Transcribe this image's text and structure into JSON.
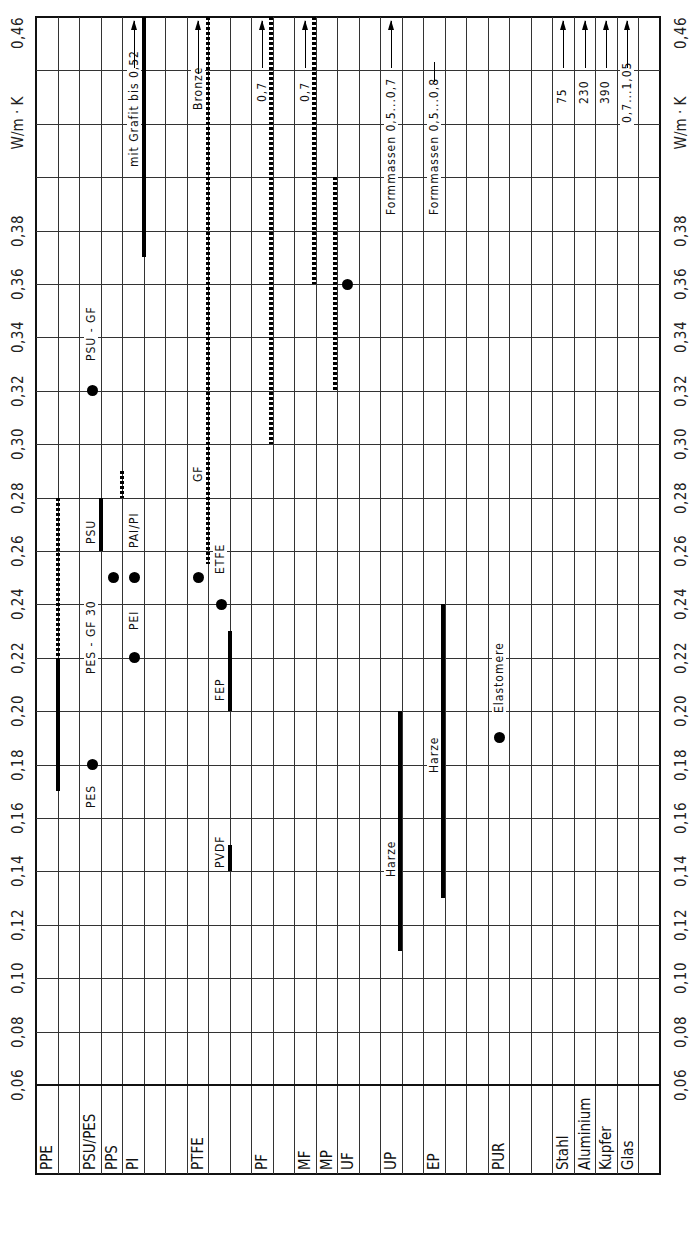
{
  "chart_data": {
    "type": "range-bar",
    "orientation": "rotated-90",
    "title": "",
    "ylabel": "W/m·K",
    "ylim": [
      0.06,
      0.46
    ],
    "y_ticks": [
      "0,06",
      "0,08",
      "0,10",
      "0,12",
      "0,14",
      "0,16",
      "0,18",
      "0,20",
      "0,22",
      "0,24",
      "0,26",
      "0,28",
      "0,30",
      "0,32",
      "0,34",
      "0,36",
      "0,38",
      "W/m·K",
      "0,46"
    ],
    "unit_label": "W/m·K",
    "grid": true,
    "categories": [
      "PPE",
      "PSU/PES",
      "PPS",
      "PI",
      "PTFE",
      "PF",
      "MF",
      "MP",
      "UF",
      "UP",
      "EP",
      "PUR",
      "Stahl",
      "Aluminium",
      "Kupfer",
      "Glas"
    ],
    "ranges": [
      {
        "material": "PPE",
        "style": "solid",
        "from": 0.17,
        "to": 0.22
      },
      {
        "material": "PPE",
        "style": "dotted",
        "from": 0.22,
        "to": 0.28
      },
      {
        "material": "PSU",
        "label": "PSU",
        "style": "solid",
        "from": 0.26,
        "to": 0.28
      },
      {
        "material": "PPS",
        "style": "dotted",
        "from": 0.28,
        "to": 0.29
      },
      {
        "material": "PI",
        "label": "mit Grafit  bis 0,52",
        "style": "solid",
        "from": 0.37,
        "to": 0.46,
        "arrow": true
      },
      {
        "material": "PTFE",
        "label": "GF",
        "style": "dotted",
        "from": 0.255,
        "to": 0.46
      },
      {
        "material": "PTFE",
        "label": "Bronze",
        "style": "dotted",
        "from": 0.4,
        "to": 0.46,
        "arrow": true
      },
      {
        "material": "FEP",
        "label": "FEP",
        "style": "solid",
        "from": 0.2,
        "to": 0.23
      },
      {
        "material": "PVDF",
        "label": "PVDF",
        "style": "solid",
        "from": 0.14,
        "to": 0.15
      },
      {
        "material": "PF",
        "label": "0,7",
        "style": "dotted",
        "from": 0.3,
        "to": 0.46,
        "arrow": true
      },
      {
        "material": "MF",
        "label": "0,7",
        "style": "dotted",
        "from": 0.36,
        "to": 0.46,
        "arrow": true
      },
      {
        "material": "UF",
        "style": "dotted",
        "from": 0.32,
        "to": 0.4
      },
      {
        "material": "UP",
        "label": "Harze",
        "style": "solid",
        "from": 0.11,
        "to": 0.2
      },
      {
        "material": "UP",
        "label": "Formmassen  0,5...0,7",
        "style": "arrow",
        "from": 0.46,
        "to": 0.7
      },
      {
        "material": "EP",
        "label": "Harze",
        "style": "solid",
        "from": 0.13,
        "to": 0.24
      },
      {
        "material": "EP",
        "label": "Formmassen  0,5...0,8",
        "style": "arrow",
        "from": 0.46,
        "to": 0.8
      },
      {
        "material": "Stahl",
        "label": "75",
        "style": "arrow",
        "value": 75
      },
      {
        "material": "Aluminium",
        "label": "230",
        "style": "arrow",
        "value": 230
      },
      {
        "material": "Kupfer",
        "label": "390",
        "style": "arrow",
        "value": 390
      },
      {
        "material": "Glas",
        "label": "0,7...1,05",
        "style": "arrow",
        "from": 0.7,
        "to": 1.05
      }
    ],
    "points": [
      {
        "label": "PES",
        "value": 0.18
      },
      {
        "label": "PES-GF30",
        "value": 0.24
      },
      {
        "label": "PSU-GF",
        "value": 0.32
      },
      {
        "label": "PPS",
        "value": 0.25
      },
      {
        "label": "PAI/PI",
        "value": 0.25
      },
      {
        "label": "PEI",
        "value": 0.22
      },
      {
        "label": "PTFE",
        "value": 0.25
      },
      {
        "label": "ETFE",
        "value": 0.24
      },
      {
        "label": "UF",
        "value": 0.36
      },
      {
        "label": "Elastomere",
        "value": 0.19
      }
    ]
  },
  "axis": {
    "ticks": [
      "0,06",
      "0,08",
      "0,10",
      "0,12",
      "0,14",
      "0,16",
      "0,18",
      "0,20",
      "0,22",
      "0,24",
      "0,26",
      "0,28",
      "0,30",
      "0,32",
      "0,34",
      "0,36",
      "0,38"
    ],
    "top": "0,46",
    "unit": "W/m · K"
  },
  "materials": [
    {
      "label": "PPE",
      "col": 0
    },
    {
      "label": "PSU/PES",
      "col": 2
    },
    {
      "label": "PPS",
      "col": 3
    },
    {
      "label": "PI",
      "col": 4
    },
    {
      "label": "PTFE",
      "col": 7
    },
    {
      "label": "PF",
      "col": 10
    },
    {
      "label": "MF",
      "col": 12
    },
    {
      "label": "MP",
      "col": 13
    },
    {
      "label": "UF",
      "col": 14
    },
    {
      "label": "UP",
      "col": 16
    },
    {
      "label": "EP",
      "col": 18
    },
    {
      "label": "PUR",
      "col": 21
    },
    {
      "label": "Stahl",
      "col": 24
    },
    {
      "label": "Aluminium",
      "col": 25
    },
    {
      "label": "Kupfer",
      "col": 26
    },
    {
      "label": "Glas",
      "col": 27
    }
  ],
  "annotations": {
    "pes": "PES",
    "pes_gf30": "PES - GF 30",
    "psu_gf": "PSU - GF",
    "psu": "PSU",
    "pai_pi": "PAI/PI",
    "pei": "PEI",
    "pi_grafit": "mit Grafit   bis 0,52",
    "gf": "GF",
    "bronze": "Bronze",
    "etfe": "ETFE",
    "fep": "FEP",
    "pvdf": "PVDF",
    "pf_07": "0,7",
    "mf_07": "0,7",
    "up_harze": "Harze",
    "ep_harze": "Harze",
    "up_form": "Formmassen   0,5...0,7",
    "ep_form": "Formmassen   0,5...0,8",
    "elastomere": "Elastomere",
    "stahl": "75",
    "alu": "230",
    "kupfer": "390",
    "glas": "0,7...1,05"
  }
}
